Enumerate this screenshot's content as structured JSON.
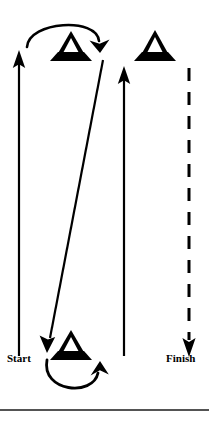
{
  "figure": {
    "background_color": "#ffffff",
    "stroke_color": "#000000",
    "width": 209,
    "height": 422
  },
  "labels": {
    "start": "Start",
    "finish": "Finish"
  },
  "cones": [
    {
      "id": "cone-2",
      "number": "2",
      "x": 71,
      "y": 46
    },
    {
      "id": "cone-3",
      "number": "3",
      "x": 155,
      "y": 46
    },
    {
      "id": "cone-1",
      "number": "1",
      "x": 71,
      "y": 345
    }
  ],
  "paths": [
    {
      "id": "left-up-arrow",
      "kind": "solid-arrow",
      "direction": "up",
      "from": [
        19,
        356
      ],
      "to": [
        19,
        52
      ]
    },
    {
      "id": "diagonal-arrow",
      "kind": "solid-arrow",
      "direction": "down-left",
      "from": [
        102,
        60
      ],
      "to": [
        47,
        352
      ]
    },
    {
      "id": "middle-up-arrow",
      "kind": "solid-arrow",
      "direction": "up",
      "from": [
        124,
        356
      ],
      "to": [
        124,
        66
      ]
    },
    {
      "id": "right-dashed-arrow",
      "kind": "dashed-arrow",
      "direction": "down",
      "from": [
        189,
        68
      ],
      "to": [
        189,
        356
      ]
    },
    {
      "id": "top-turn-arc",
      "kind": "curved-arrow",
      "direction": "clockwise",
      "around": "cone-2"
    },
    {
      "id": "bottom-turn-arc",
      "kind": "curved-arrow",
      "direction": "counter-clockwise",
      "around": "cone-1"
    }
  ],
  "divider": {
    "id": "bottom-rule",
    "y": 410
  }
}
